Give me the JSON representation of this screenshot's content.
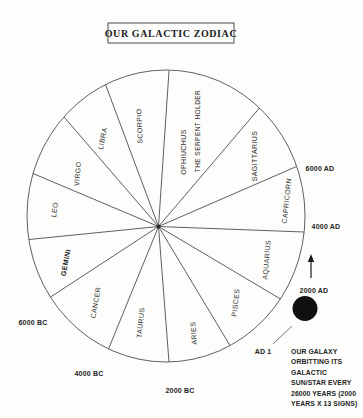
{
  "title": "OUR GALACTIC ZODIAC",
  "wheel": {
    "signs": [
      {
        "label": "OPHIUCHUS",
        "sublabel": "THE SERPENT HOLDER"
      },
      {
        "label": "SAGITTARIUS"
      },
      {
        "label": "CAPRICORN"
      },
      {
        "label": "AQUARIUS"
      },
      {
        "label": "PISCES"
      },
      {
        "label": "ARIES"
      },
      {
        "label": "TAURUS"
      },
      {
        "label": "CANCER"
      },
      {
        "label": "GEMINI",
        "emphasis": "bold"
      },
      {
        "label": "LEO"
      },
      {
        "label": "VIRGO"
      },
      {
        "label": "LIBRA"
      },
      {
        "label": "SCORPIO"
      }
    ],
    "sector_count": 13
  },
  "timeline": {
    "markers": [
      {
        "label": "6000 AD"
      },
      {
        "label": "4000 AD"
      },
      {
        "label": "2000 AD"
      },
      {
        "label": "AD 1"
      },
      {
        "label": "2000 BC"
      },
      {
        "label": "4000 BC"
      },
      {
        "label": "6000 BC"
      }
    ]
  },
  "annotation": {
    "lines": [
      "OUR GALAXY",
      "ORBITTING ITS",
      "GALACTIC",
      "SUN/STAR EVERY",
      "26000 YEARS (2000",
      "YEARS X 13 SIGNS)"
    ]
  },
  "colors": {
    "ink": "#4d4d4d",
    "text": "#242424",
    "sun_dot": "#101010",
    "background": "#fdfdfb"
  }
}
